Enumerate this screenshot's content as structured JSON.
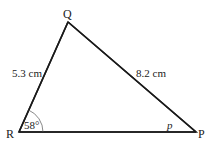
{
  "diagram": {
    "vertices": {
      "Q": "Q",
      "R": "R",
      "P": "P"
    },
    "sides": {
      "QR": "5.3 cm",
      "QP": "8.2 cm"
    },
    "angles": {
      "R": "58°",
      "P": "p"
    },
    "colors": {
      "stroke": "#1a1a1a",
      "arc": "#555555",
      "text": "#222222"
    }
  }
}
